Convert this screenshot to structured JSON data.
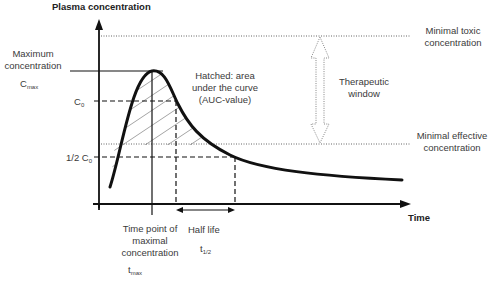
{
  "diagram": {
    "y_axis_label": "Plasma concentration",
    "x_axis_label": "Time",
    "cmax_label_line1": "Maximum",
    "cmax_label_line2": "concentration",
    "cmax_symbol": "C",
    "cmax_subscript": "max",
    "c0_symbol": "C",
    "c0_subscript": "0",
    "half_c0_prefix": "1/2 C",
    "half_c0_subscript": "0",
    "auc_line1": "Hatched: area",
    "auc_line2": "under the curve",
    "auc_line3": "(AUC-value)",
    "therapeutic_line1": "Therapeutic",
    "therapeutic_line2": "window",
    "min_toxic_line1": "Minimal toxic",
    "min_toxic_line2": "concentration",
    "min_effective_line1": "Minimal effective",
    "min_effective_line2": "concentration",
    "tmax_line1": "Time point of",
    "tmax_line2": "maximal",
    "tmax_line3": "concentration",
    "tmax_symbol": "t",
    "tmax_subscript": "max",
    "half_life_label": "Half  life",
    "half_life_symbol": "t",
    "half_life_subscript": "1/2"
  },
  "colors": {
    "curve": "#111111",
    "axis": "#111111",
    "hatch": "#9a9a9a",
    "dotted": "#666666",
    "text": "#3a3a3a"
  }
}
